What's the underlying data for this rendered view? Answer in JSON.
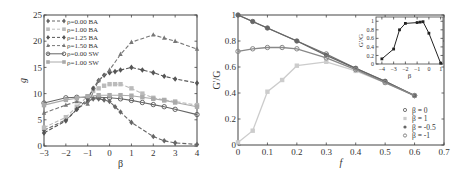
{
  "chart_data": [
    {
      "type": "line",
      "title": "",
      "xlabel": "β",
      "ylabel": "g",
      "xlim": [
        -3,
        4
      ],
      "ylim": [
        0,
        25
      ],
      "xticks": [
        -3,
        -2,
        -1,
        0,
        1,
        2,
        3,
        4
      ],
      "yticks": [
        0,
        5,
        10,
        15,
        20,
        25
      ],
      "legend_position": "upper left",
      "series": [
        {
          "name": "ρ=0.00 BA",
          "color": "#666666",
          "dash": true,
          "marker": "diamond",
          "x": [
            -3,
            -2,
            -1.5,
            -1,
            -0.75,
            -0.5,
            -0.25,
            0,
            0.25,
            0.5,
            1,
            2,
            2.5,
            3,
            4
          ],
          "y": [
            3,
            5,
            7,
            8.5,
            9,
            9,
            8.8,
            8.5,
            7.5,
            6.5,
            4.5,
            1.8,
            1.0,
            0.6,
            0.3
          ]
        },
        {
          "name": "ρ=1.00 BA",
          "color": "#bbbbbb",
          "dash": true,
          "marker": "square",
          "x": [
            -3,
            -2,
            -1.5,
            -1,
            -0.75,
            -0.5,
            -0.25,
            0,
            0.25,
            0.5,
            1,
            1.5,
            2,
            2.5,
            3,
            4
          ],
          "y": [
            3.5,
            5.5,
            7.5,
            9.5,
            10.5,
            11,
            11.5,
            11.8,
            11.8,
            11.8,
            11,
            10,
            9.2,
            8.8,
            8.5,
            7.8
          ]
        },
        {
          "name": "ρ=1.25 BA",
          "color": "#555555",
          "dash": true,
          "marker": "diamond",
          "x": [
            -3,
            -2,
            -1.5,
            -1,
            -0.75,
            -0.5,
            -0.25,
            0,
            0.25,
            0.5,
            1,
            1.5,
            2,
            2.5,
            3,
            4
          ],
          "y": [
            2.5,
            4.8,
            7,
            9,
            11,
            12.5,
            13.5,
            14,
            14.2,
            14.5,
            15,
            14.5,
            14,
            13.3,
            12.8,
            12
          ]
        },
        {
          "name": "ρ=1.50 BA",
          "color": "#777777",
          "dash": true,
          "marker": "triangle",
          "x": [
            -3,
            -2,
            -1.5,
            -1,
            -0.5,
            0,
            0.5,
            1,
            2,
            2.5,
            3,
            4
          ],
          "y": [
            6.3,
            7.8,
            8.5,
            8.0,
            12.5,
            14.5,
            17.5,
            19.8,
            21.2,
            20.6,
            20,
            18.5
          ]
        },
        {
          "name": "ρ=0.00 SW",
          "color": "#666666",
          "dash": false,
          "marker": "circle",
          "x": [
            -3,
            -2,
            -1.5,
            -1,
            -0.5,
            0,
            0.5,
            1,
            1.5,
            2,
            2.5,
            3,
            4
          ],
          "y": [
            8.2,
            9.2,
            9.3,
            9.3,
            9.3,
            9.2,
            9.0,
            8.7,
            8.3,
            7.9,
            7.5,
            7.0,
            6.0
          ]
        },
        {
          "name": "ρ=1.00 SW",
          "color": "#aaaaaa",
          "dash": false,
          "marker": "square",
          "x": [
            -3,
            -2,
            -1.5,
            -1,
            -0.5,
            0,
            0.5,
            1,
            1.5,
            2,
            2.5,
            3,
            4
          ],
          "y": [
            7.8,
            8.8,
            9.1,
            9.5,
            9.7,
            9.7,
            9.7,
            9.6,
            9.3,
            9.0,
            8.7,
            8.3,
            7.5
          ]
        }
      ]
    },
    {
      "type": "line",
      "title": "",
      "xlabel": "f",
      "ylabel": "G'/G",
      "xlim": [
        0,
        0.7
      ],
      "ylim": [
        0,
        1
      ],
      "xticks": [
        0,
        0.1,
        0.2,
        0.3,
        0.4,
        0.5,
        0.6,
        0.7
      ],
      "yticks": [
        0,
        0.2,
        0.4,
        0.6,
        0.8,
        1
      ],
      "legend_position": "lower right",
      "series": [
        {
          "name": "β = 0",
          "color": "#777777",
          "marker": "circle",
          "x": [
            0,
            0.05,
            0.1,
            0.2,
            0.3,
            0.4,
            0.5,
            0.6
          ],
          "y": [
            1.0,
            0.95,
            0.9,
            0.8,
            0.7,
            0.59,
            0.49,
            0.38
          ]
        },
        {
          "name": "β = 1",
          "color": "#cccccc",
          "marker": "square",
          "x": [
            0,
            0.05,
            0.1,
            0.15,
            0.2,
            0.3,
            0.4,
            0.5,
            0.6
          ],
          "y": [
            0.02,
            0.11,
            0.41,
            0.5,
            0.61,
            0.64,
            0.57,
            0.48,
            0.38
          ]
        },
        {
          "name": "β = -0.5",
          "color": "#666666",
          "marker": "star",
          "x": [
            0,
            0.05,
            0.1,
            0.2,
            0.3,
            0.4,
            0.5,
            0.6
          ],
          "y": [
            1.0,
            0.95,
            0.9,
            0.8,
            0.69,
            0.59,
            0.49,
            0.38
          ]
        },
        {
          "name": "β = -1",
          "color": "#888888",
          "marker": "circle",
          "x": [
            0,
            0.05,
            0.1,
            0.15,
            0.2,
            0.3,
            0.4,
            0.5,
            0.6
          ],
          "y": [
            0.72,
            0.74,
            0.75,
            0.75,
            0.74,
            0.67,
            0.58,
            0.48,
            0.38
          ]
        }
      ],
      "inset": {
        "type": "line",
        "xlabel": "β",
        "ylabel": "G'/G",
        "xlim": [
          -4.5,
          1.2
        ],
        "ylim": [
          0,
          1.1
        ],
        "xticks": [
          -4,
          -3,
          -2,
          -1,
          0,
          1
        ],
        "yticks": [
          0,
          0.2,
          0.4,
          0.6,
          0.8,
          1
        ],
        "series": [
          {
            "name": "inset",
            "color": "#222222",
            "marker": "square",
            "x": [
              -4,
              -3,
              -2.5,
              -2,
              -1,
              -0.75,
              -0.5,
              0,
              1
            ],
            "y": [
              0.12,
              0.35,
              0.8,
              0.95,
              0.97,
              0.98,
              0.99,
              0.72,
              0.02
            ]
          }
        ]
      }
    }
  ]
}
